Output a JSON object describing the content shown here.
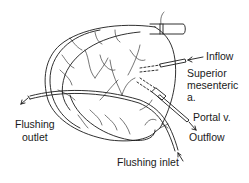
{
  "diagram": {
    "labels": {
      "inflow": "Inflow",
      "sma_line1": "Superior",
      "sma_line2": "mesenteric",
      "sma_line3": "a.",
      "portal": "Portal v.",
      "outflow": "Outflow",
      "flushing_outlet_line1": "Flushing",
      "flushing_outlet_line2": "outlet",
      "flushing_inlet": "Flushing inlet"
    },
    "colors": {
      "ink": "#1a1a1a",
      "background": "#ffffff"
    }
  }
}
